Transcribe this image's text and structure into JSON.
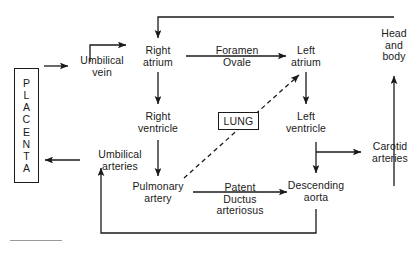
{
  "diagram": {
    "background_color": "#ffffff",
    "stroke_color": "#1a1a1a",
    "text_color": "#1a1a1a",
    "footer_rule_color": "#9a9a9a",
    "nodes": {
      "placenta": {
        "label": "PLACENTA",
        "letters": [
          "P",
          "L",
          "A",
          "C",
          "E",
          "N",
          "T",
          "A"
        ],
        "shape": "box-vertical-text"
      },
      "umbilical_vein": {
        "label": "Umbilical\nvein",
        "shape": "text"
      },
      "umbilical_arteries": {
        "label": "Umbilical\narteries",
        "shape": "text"
      },
      "right_atrium": {
        "label": "Right\natrium",
        "shape": "text"
      },
      "right_ventricle": {
        "label": "Right\nventricle",
        "shape": "text"
      },
      "pulmonary_artery": {
        "label": "Pulmonary\nartery",
        "shape": "text"
      },
      "lung": {
        "label": "LUNG",
        "shape": "box"
      },
      "left_atrium": {
        "label": "Left\natrium",
        "shape": "text"
      },
      "left_ventricle": {
        "label": "Left\nventricle",
        "shape": "text"
      },
      "descending_aorta": {
        "label": "Descending\naorta",
        "shape": "text"
      },
      "carotid_arteries": {
        "label": "Carotid\narteries",
        "shape": "text"
      },
      "head_and_body": {
        "label": "Head\nand\nbody",
        "shape": "text"
      }
    },
    "edge_labels": {
      "foramen_ovale": {
        "label": "Foramen\nOvale"
      },
      "patent_ductus_arteriosus": {
        "label": "Patent\nDuctus\narteriosus"
      }
    },
    "edges": [
      {
        "from": "placenta",
        "to": "umbilical_vein",
        "style": "solid",
        "arrow": "end"
      },
      {
        "from": "umbilical_vein",
        "to": "right_atrium",
        "style": "solid",
        "arrow": "end"
      },
      {
        "from": "right_atrium",
        "to": "left_atrium",
        "style": "solid",
        "arrow": "end",
        "label": "foramen_ovale"
      },
      {
        "from": "right_atrium",
        "to": "right_ventricle",
        "style": "solid",
        "arrow": "end"
      },
      {
        "from": "right_ventricle",
        "to": "pulmonary_artery",
        "style": "solid",
        "arrow": "end"
      },
      {
        "from": "pulmonary_artery",
        "to": "left_atrium",
        "style": "dashed",
        "arrow": "end",
        "through": "lung"
      },
      {
        "from": "pulmonary_artery",
        "to": "descending_aorta",
        "style": "solid",
        "arrow": "end",
        "label": "patent_ductus_arteriosus"
      },
      {
        "from": "left_atrium",
        "to": "left_ventricle",
        "style": "solid",
        "arrow": "end"
      },
      {
        "from": "left_ventricle",
        "to": "descending_aorta",
        "style": "solid",
        "arrow": "end"
      },
      {
        "from": "left_ventricle",
        "to": "carotid_arteries",
        "style": "solid",
        "arrow": "end"
      },
      {
        "from": "carotid_arteries",
        "to": "head_and_body",
        "style": "solid",
        "arrow": "end"
      },
      {
        "from": "head_and_body",
        "to": "right_atrium",
        "style": "solid",
        "arrow": "end"
      },
      {
        "from": "descending_aorta",
        "to": "umbilical_arteries",
        "style": "solid",
        "arrow": "end"
      },
      {
        "from": "umbilical_arteries",
        "to": "placenta",
        "style": "solid",
        "arrow": "end"
      }
    ]
  }
}
